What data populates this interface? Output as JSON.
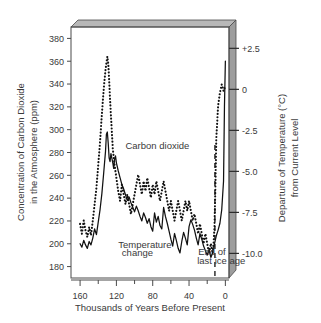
{
  "chart_data": {
    "type": "line",
    "title": "",
    "xlabel": "Thousands of Years Before Present",
    "ylabel_left": "Concentration of Carbon Dioxide in the Atmosphere (ppm)",
    "ylabel_right": "Departure of Temperature (°C) from Current Level",
    "xlim": [
      170,
      -4
    ],
    "x_direction": "reversed",
    "ylim_left": [
      170,
      390
    ],
    "ylim_right": [
      -11.5,
      3.8
    ],
    "grid": false,
    "legend": "inline-annotations",
    "xticks_major": [
      160,
      120,
      80,
      40,
      0
    ],
    "xticks_minor": [
      140,
      100,
      60,
      20
    ],
    "yticks_left": [
      180,
      200,
      220,
      240,
      260,
      280,
      300,
      320,
      340,
      360,
      380
    ],
    "yticks_right": [
      "+2.5",
      "0",
      "-2.5",
      "-5.0",
      "-7.5",
      "-10.0"
    ],
    "yticks_right_values": [
      2.5,
      0,
      -2.5,
      -5.0,
      -7.5,
      -10.0
    ],
    "annotations": [
      {
        "text": "Carbon dioxide",
        "x": 110,
        "y": 283
      },
      {
        "text": "Temperature",
        "x": 118,
        "y": 196
      },
      {
        "text": "change",
        "x": 114,
        "y": 189
      },
      {
        "text": "End of",
        "x": 30,
        "y": 190
      },
      {
        "text": "last ice age",
        "x": 31,
        "y": 182
      }
    ],
    "marker_line": {
      "label": "End of last ice age",
      "x": 11.5,
      "style": "dashed"
    },
    "series": [
      {
        "name": "Carbon dioxide",
        "style": "solid",
        "axis": "left",
        "unit": "ppm",
        "x": [
          160,
          158,
          156,
          154,
          152,
          150,
          148,
          146,
          144,
          142,
          140,
          138,
          136,
          134,
          132,
          131,
          130,
          129,
          128,
          127,
          126,
          125,
          124,
          123,
          122,
          121,
          120,
          118,
          116,
          114,
          112,
          110,
          108,
          106,
          104,
          102,
          100,
          98,
          96,
          94,
          92,
          90,
          88,
          86,
          84,
          82,
          80,
          78,
          76,
          74,
          72,
          70,
          68,
          66,
          64,
          62,
          60,
          58,
          56,
          54,
          52,
          50,
          48,
          46,
          44,
          42,
          40,
          38,
          36,
          34,
          32,
          30,
          28,
          26,
          24,
          22,
          20,
          18,
          16,
          14,
          12,
          10,
          8,
          6,
          4,
          2,
          1,
          0
        ],
        "y": [
          200,
          197,
          203,
          199,
          196,
          202,
          199,
          205,
          213,
          208,
          219,
          230,
          244,
          262,
          281,
          296,
          298,
          288,
          275,
          272,
          279,
          275,
          271,
          266,
          274,
          277,
          271,
          264,
          258,
          252,
          248,
          243,
          238,
          241,
          236,
          232,
          228,
          233,
          229,
          224,
          220,
          227,
          223,
          218,
          222,
          215,
          211,
          227,
          219,
          224,
          216,
          213,
          232,
          224,
          218,
          211,
          204,
          198,
          209,
          203,
          196,
          192,
          202,
          210,
          205,
          199,
          215,
          221,
          217,
          212,
          205,
          199,
          209,
          204,
          198,
          194,
          190,
          195,
          188,
          192,
          200,
          207,
          212,
          218,
          230,
          255,
          320,
          360
        ]
      },
      {
        "name": "Temperature change",
        "style": "dotted",
        "axis": "right",
        "unit": "°C",
        "x": [
          160,
          158,
          156,
          154,
          152,
          150,
          148,
          146,
          144,
          142,
          140,
          138,
          136,
          134,
          132,
          130,
          129,
          128,
          127,
          126,
          125,
          124,
          122,
          120,
          118,
          116,
          114,
          112,
          110,
          108,
          106,
          104,
          102,
          100,
          98,
          96,
          94,
          92,
          90,
          88,
          86,
          84,
          82,
          80,
          78,
          76,
          74,
          72,
          70,
          68,
          66,
          64,
          62,
          60,
          58,
          56,
          54,
          52,
          50,
          48,
          46,
          44,
          42,
          40,
          38,
          36,
          34,
          32,
          30,
          28,
          26,
          24,
          22,
          20,
          18,
          16,
          14,
          13,
          12,
          11,
          10,
          8,
          6,
          4,
          2,
          0
        ],
        "y": [
          -8.2,
          -8.8,
          -8.0,
          -8.6,
          -9.0,
          -8.4,
          -8.9,
          -8.0,
          -7.0,
          -6.0,
          -4.6,
          -3.2,
          -1.5,
          0.0,
          1.2,
          2.0,
          1.6,
          0.6,
          -0.6,
          -1.6,
          -2.6,
          -3.6,
          -4.6,
          -5.4,
          -6.2,
          -6.8,
          -5.8,
          -6.4,
          -7.0,
          -6.4,
          -7.0,
          -7.6,
          -7.0,
          -6.4,
          -5.8,
          -5.2,
          -5.8,
          -6.4,
          -5.6,
          -6.2,
          -5.4,
          -6.0,
          -6.6,
          -5.8,
          -6.4,
          -5.6,
          -6.2,
          -6.8,
          -6.2,
          -5.6,
          -6.2,
          -6.8,
          -7.4,
          -6.8,
          -7.4,
          -8.0,
          -7.4,
          -6.8,
          -7.4,
          -8.0,
          -7.4,
          -6.8,
          -7.4,
          -6.8,
          -7.4,
          -8.0,
          -7.6,
          -8.2,
          -8.8,
          -8.2,
          -8.8,
          -9.4,
          -8.8,
          -9.4,
          -10.0,
          -9.4,
          -10.0,
          -9.4,
          -8.4,
          -6.0,
          -3.0,
          -1.0,
          -0.2,
          0.3,
          -0.1,
          0.2
        ]
      }
    ]
  },
  "style": {
    "line_color": "#111111",
    "frame_top_fill": "#b8b8b8",
    "frame_right_fill": "#9d9d9d",
    "frame_stroke": "#4a4a4a",
    "text_color": "#3a3a3a"
  }
}
